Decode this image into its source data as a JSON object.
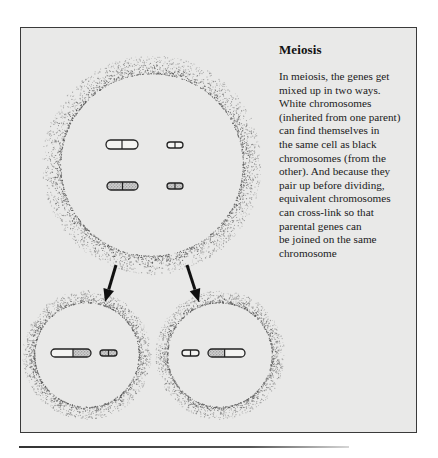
{
  "figure": {
    "title": "Meiosis",
    "caption_lines": [
      "In meiosis, the genes get",
      "mixed up in two ways.",
      "White chromosomes",
      "(inherited from one parent)",
      "can find themselves in",
      "the same cell as black",
      "chromosomes (from the",
      "other). And because they",
      "pair up before dividing,",
      "equivalent chromosomes",
      "can cross-link so that",
      "parental genes can",
      "be joined on the same",
      "chromosome"
    ],
    "colors": {
      "frame_fill": "#e9e9e8",
      "frame_border": "#3a3a3a",
      "stipple": "#555555",
      "chromosome_outline": "#222222",
      "speckle_fill": "#b5b5b5"
    }
  },
  "diagram": {
    "parent_cell": {
      "label": "parent-cell",
      "cx": 152,
      "cy": 165,
      "r": 92,
      "chromosomes": [
        {
          "type": "white",
          "size": "large",
          "x": 106,
          "y": 140,
          "w": 32,
          "h": 9,
          "split": 0.5
        },
        {
          "type": "white",
          "size": "small",
          "x": 167,
          "y": 142,
          "w": 16,
          "h": 6,
          "split": 0.5
        },
        {
          "type": "black",
          "size": "large",
          "x": 107,
          "y": 182,
          "w": 31,
          "h": 8,
          "split": 0.5
        },
        {
          "type": "black",
          "size": "small",
          "x": 167,
          "y": 183,
          "w": 16,
          "h": 6,
          "split": 0.5
        }
      ]
    },
    "arrows": [
      {
        "from": [
          116,
          265
        ],
        "to": [
          105,
          302
        ]
      },
      {
        "from": [
          187,
          265
        ],
        "to": [
          199,
          302
        ]
      }
    ],
    "daughter_cells": [
      {
        "label": "daughter-cell-left",
        "cx": 87,
        "cy": 355,
        "r": 53,
        "chromosomes": [
          {
            "type": "crossed-white-black",
            "size": "large",
            "x": 51,
            "y": 349,
            "w": 40,
            "h": 8,
            "split": 0.55
          },
          {
            "type": "black",
            "size": "small",
            "x": 100,
            "y": 350,
            "w": 17,
            "h": 6,
            "split": 0.5
          }
        ]
      },
      {
        "label": "daughter-cell-right",
        "cx": 220,
        "cy": 355,
        "r": 53,
        "chromosomes": [
          {
            "type": "white",
            "size": "small",
            "x": 182,
            "y": 350,
            "w": 17,
            "h": 6,
            "split": 0.5
          },
          {
            "type": "crossed-black-white",
            "size": "large",
            "x": 208,
            "y": 349,
            "w": 37,
            "h": 8,
            "split": 0.45
          }
        ]
      }
    ]
  }
}
